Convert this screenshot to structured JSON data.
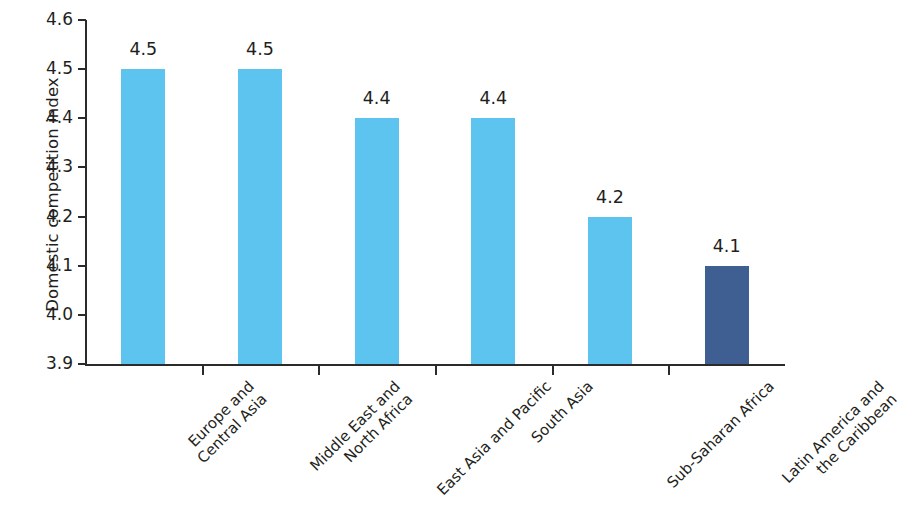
{
  "chart_data": {
    "type": "bar",
    "title": "",
    "xlabel": "",
    "ylabel": "Domestic competition index",
    "ylim": [
      3.9,
      4.6
    ],
    "ytick_labels": [
      "4.6",
      "4.5",
      "4.4",
      "4.3",
      "4.2",
      "4.1",
      "4.0",
      "3.9"
    ],
    "ytick_values": [
      4.6,
      4.5,
      4.4,
      4.3,
      4.2,
      4.1,
      4.0,
      3.9
    ],
    "grid": false,
    "legend": null,
    "categories": [
      "Europe and Central Asia",
      "Middle East and North Africa",
      "East Asia and Pacific",
      "South Asia",
      "Sub-Saharan Africa",
      "Latin America and the Caribbean"
    ],
    "category_lines": [
      [
        "Europe and",
        "Central Asia"
      ],
      [
        "Middle East and",
        "North Africa"
      ],
      [
        "East Asia and Pacific"
      ],
      [
        "South Asia"
      ],
      [
        "Sub-Saharan Africa"
      ],
      [
        "Latin America and",
        "the Caribbean"
      ]
    ],
    "values": [
      4.5,
      4.5,
      4.4,
      4.4,
      4.2,
      4.1
    ],
    "value_labels": [
      "4.5",
      "4.5",
      "4.4",
      "4.4",
      "4.2",
      "4.1"
    ],
    "bar_colors": [
      "#5cc4ee",
      "#5cc4ee",
      "#5cc4ee",
      "#5cc4ee",
      "#5cc4ee",
      "#3f5f93"
    ],
    "colors": {
      "bar_light_blue": "#5cc4ee",
      "bar_dark_blue": "#3f5f93",
      "axis": "#2b2b2b",
      "text": "#231f20",
      "background": "#ffffff"
    }
  }
}
